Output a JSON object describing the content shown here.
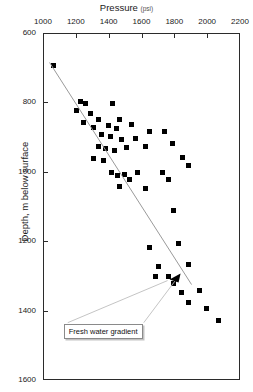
{
  "chart_data": {
    "type": "scatter",
    "title": "Pressure",
    "title_unit": "(psi)",
    "xlabel": "Pressure (psi)",
    "ylabel": "Depth, m below surface",
    "xlim": [
      1000,
      2200
    ],
    "ylim": [
      600,
      1600
    ],
    "y_inverted": true,
    "x_axis_position": "top",
    "grid": false,
    "legend": null,
    "xticks": [
      1000,
      1200,
      1400,
      1600,
      1800,
      2000,
      2200
    ],
    "yticks": [
      600,
      800,
      1000,
      1200,
      1400,
      1600
    ],
    "series": [
      {
        "name": "Pressure measurements",
        "marker": "square",
        "color": "#000000",
        "points": [
          [
            1060,
            690
          ],
          [
            1220,
            795
          ],
          [
            1255,
            800
          ],
          [
            1200,
            820
          ],
          [
            1285,
            830
          ],
          [
            1420,
            800
          ],
          [
            1460,
            845
          ],
          [
            1240,
            855
          ],
          [
            1330,
            845
          ],
          [
            1300,
            870
          ],
          [
            1390,
            865
          ],
          [
            1440,
            872
          ],
          [
            1530,
            862
          ],
          [
            1350,
            890
          ],
          [
            1405,
            895
          ],
          [
            1470,
            905
          ],
          [
            1560,
            900
          ],
          [
            1640,
            880
          ],
          [
            1735,
            880
          ],
          [
            1330,
            925
          ],
          [
            1375,
            930
          ],
          [
            1430,
            935
          ],
          [
            1505,
            928
          ],
          [
            1620,
            925
          ],
          [
            1780,
            915
          ],
          [
            1300,
            960
          ],
          [
            1360,
            965
          ],
          [
            1845,
            955
          ],
          [
            1880,
            978
          ],
          [
            1410,
            1000
          ],
          [
            1450,
            1008
          ],
          [
            1490,
            1005
          ],
          [
            1520,
            1018
          ],
          [
            1570,
            1000
          ],
          [
            1720,
            1000
          ],
          [
            1760,
            1020
          ],
          [
            1460,
            1040
          ],
          [
            1620,
            1045
          ],
          [
            1790,
            1110
          ],
          [
            1640,
            1215
          ],
          [
            1820,
            1205
          ],
          [
            1700,
            1270
          ],
          [
            1880,
            1265
          ],
          [
            1680,
            1300
          ],
          [
            1760,
            1300
          ],
          [
            1790,
            1318
          ],
          [
            1840,
            1345
          ],
          [
            1950,
            1340
          ],
          [
            1880,
            1375
          ],
          [
            1990,
            1390
          ],
          [
            2060,
            1425
          ]
        ]
      }
    ],
    "annotations": [
      {
        "type": "line",
        "name": "fresh-water-gradient",
        "label": "Fresh water gradient",
        "color": "#9a9a9a",
        "from": [
          1040,
          685
        ],
        "to": [
          1905,
          1325
        ]
      },
      {
        "type": "textbox",
        "name": "fresh-water-gradient-label",
        "text": "Fresh water gradient",
        "at": [
          1370,
          1455
        ]
      }
    ]
  }
}
